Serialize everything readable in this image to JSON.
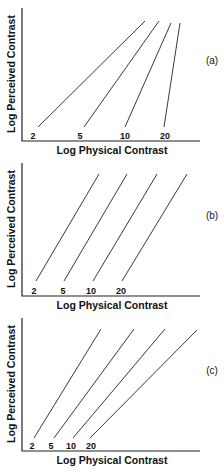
{
  "panels": [
    {
      "id": "a",
      "label": "(a)",
      "xlabel": "Log Physical Contrast",
      "ylabel": "Log Perceived Contrast",
      "lines": [
        {
          "label": "2",
          "x1": 38,
          "y1": 127,
          "x2": 145,
          "y2": 21,
          "lx": 33
        },
        {
          "label": "5",
          "x1": 84,
          "y1": 127,
          "x2": 159,
          "y2": 21,
          "lx": 80
        },
        {
          "label": "10",
          "x1": 125,
          "y1": 127,
          "x2": 171,
          "y2": 23,
          "lx": 125
        },
        {
          "label": "20",
          "x1": 164,
          "y1": 127,
          "x2": 180,
          "y2": 23,
          "lx": 165
        }
      ]
    },
    {
      "id": "b",
      "label": "(b)",
      "xlabel": "Log Physical Contrast",
      "ylabel": "Log Perceived Contrast",
      "lines": [
        {
          "label": "2",
          "x1": 36,
          "y1": 126,
          "x2": 99,
          "y2": 19,
          "lx": 34
        },
        {
          "label": "5",
          "x1": 64,
          "y1": 126,
          "x2": 127,
          "y2": 19,
          "lx": 63
        },
        {
          "label": "10",
          "x1": 93,
          "y1": 126,
          "x2": 157,
          "y2": 19,
          "lx": 91
        },
        {
          "label": "20",
          "x1": 122,
          "y1": 126,
          "x2": 187,
          "y2": 19,
          "lx": 121
        }
      ]
    },
    {
      "id": "c",
      "label": "(c)",
      "xlabel": "Log Physical Contrast",
      "ylabel": "Log Perceived Contrast",
      "lines": [
        {
          "label": "2",
          "x1": 34,
          "y1": 128,
          "x2": 101,
          "y2": 19,
          "lx": 32
        },
        {
          "label": "5",
          "x1": 54,
          "y1": 128,
          "x2": 134,
          "y2": 19,
          "lx": 51
        },
        {
          "label": "10",
          "x1": 73,
          "y1": 128,
          "x2": 165,
          "y2": 19,
          "lx": 71
        },
        {
          "label": "20",
          "x1": 90,
          "y1": 128,
          "x2": 197,
          "y2": 20,
          "lx": 91
        }
      ]
    }
  ],
  "chart_data": [
    {
      "type": "line",
      "title": "(a)",
      "xlabel": "Log Physical Contrast",
      "ylabel": "Log Perceived Contrast",
      "series": [
        {
          "name": "2"
        },
        {
          "name": "5"
        },
        {
          "name": "10"
        },
        {
          "name": "20"
        }
      ],
      "note": "Lines of increasing slope; steeper for higher contrast values"
    },
    {
      "type": "line",
      "title": "(b)",
      "xlabel": "Log Physical Contrast",
      "ylabel": "Log Perceived Contrast",
      "series": [
        {
          "name": "2"
        },
        {
          "name": "5"
        },
        {
          "name": "10"
        },
        {
          "name": "20"
        }
      ],
      "note": "Parallel lines of equal slope, shifted rightward"
    },
    {
      "type": "line",
      "title": "(c)",
      "xlabel": "Log Physical Contrast",
      "ylabel": "Log Perceived Contrast",
      "series": [
        {
          "name": "2"
        },
        {
          "name": "5"
        },
        {
          "name": "10"
        },
        {
          "name": "20"
        }
      ],
      "note": "Lines of decreasing slope; shallower for higher contrast values"
    }
  ]
}
